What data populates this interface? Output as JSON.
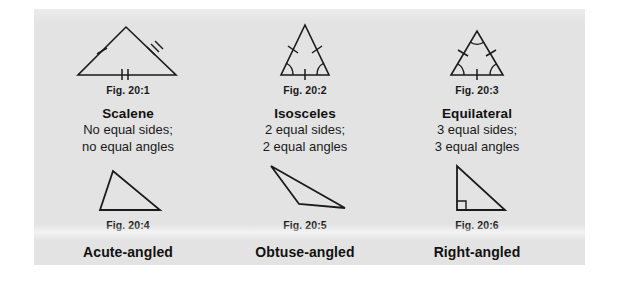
{
  "panel": {
    "background_color": "#e3e3e3",
    "page_background_color": "#ffffff",
    "ink_color": "#1a1a1a"
  },
  "figures": [
    {
      "id": "fig-20-1",
      "caption": "Fig. 20:1",
      "type_name": "Scalene",
      "description_line1": "No equal sides;",
      "description_line2": "no equal angles",
      "shape": "scalene-triangle",
      "marks": {
        "left_side_ticks": 1,
        "right_side_ticks": 3,
        "base_ticks": 2,
        "angle_arcs": 0,
        "right_angle_square": false
      }
    },
    {
      "id": "fig-20-2",
      "caption": "Fig. 20:2",
      "type_name": "Isosceles",
      "description_line1": "2 equal sides;",
      "description_line2": "2 equal angles",
      "shape": "isosceles-triangle",
      "marks": {
        "left_side_ticks": 1,
        "right_side_ticks": 1,
        "base_ticks": 1,
        "angle_arcs": 2,
        "right_angle_square": false
      }
    },
    {
      "id": "fig-20-3",
      "caption": "Fig. 20:3",
      "type_name": "Equilateral",
      "description_line1": "3 equal sides;",
      "description_line2": "3 equal angles",
      "shape": "equilateral-triangle",
      "marks": {
        "left_side_ticks": 1,
        "right_side_ticks": 1,
        "base_ticks": 1,
        "angle_arcs": 3,
        "right_angle_square": false
      }
    },
    {
      "id": "fig-20-4",
      "caption": "Fig. 20:4",
      "type_name": "Acute-angled",
      "description_line1": "",
      "description_line2": "",
      "shape": "acute-triangle",
      "marks": {
        "left_side_ticks": 0,
        "right_side_ticks": 0,
        "base_ticks": 0,
        "angle_arcs": 0,
        "right_angle_square": false
      }
    },
    {
      "id": "fig-20-5",
      "caption": "Fig. 20:5",
      "type_name": "Obtuse-angled",
      "description_line1": "",
      "description_line2": "",
      "shape": "obtuse-triangle",
      "marks": {
        "left_side_ticks": 0,
        "right_side_ticks": 0,
        "base_ticks": 0,
        "angle_arcs": 0,
        "right_angle_square": false
      }
    },
    {
      "id": "fig-20-6",
      "caption": "Fig. 20:6",
      "type_name": "Right-angled",
      "description_line1": "",
      "description_line2": "",
      "shape": "right-triangle",
      "marks": {
        "left_side_ticks": 0,
        "right_side_ticks": 0,
        "base_ticks": 0,
        "angle_arcs": 0,
        "right_angle_square": true
      }
    }
  ]
}
